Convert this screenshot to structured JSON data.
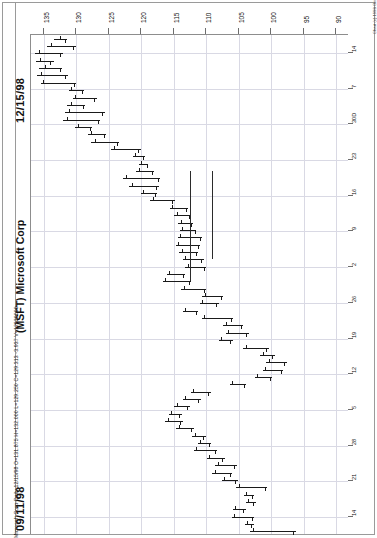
{
  "chart_data": {
    "type": "bar",
    "subtype": "ohlc-bar-chart-rotated",
    "title": "(MSFT) Microsoft Corp",
    "symbol": "MSFT",
    "company": "Microsoft Corp",
    "interval": "Daily",
    "orientation": "rotated-90-ccw",
    "grid": true,
    "legend": "none",
    "xlabel": "",
    "ylabel": "",
    "date_start_label": "09/11/98",
    "date_end_label": "12/15/98",
    "quote_line": "Microsoft Corp-Daily 12/15/98 O=131.875 H=132.000 L=129.250 C=129.313 -3.937 V=12620000",
    "quote": {
      "name": "Microsoft Corp-Daily",
      "date": "12/15/98",
      "open": 131.875,
      "high": 132.0,
      "low": 129.25,
      "close": 129.313,
      "change": -3.937,
      "volume": 12620000
    },
    "copyright": "Chart (c) 1998 Omega Research, Inc.  Data (c) Telescan",
    "price_axis": {
      "label": "Price",
      "ticks": [
        135,
        130,
        125,
        120,
        115,
        110,
        105,
        100,
        95,
        90
      ],
      "ylim": [
        137,
        88
      ]
    },
    "date_axis": {
      "label": "Date",
      "ticks": [
        "14",
        "7",
        "30D",
        "23",
        "16",
        "9",
        "2",
        "26",
        "19",
        "12",
        "5",
        "28",
        "21",
        "14"
      ],
      "months_shown": [
        "Sep",
        "Oct",
        "Nov",
        "Dec"
      ]
    },
    "series_name": "MSFT OHLC",
    "bars": [
      {
        "i": 0,
        "high": 133.5,
        "low": 131.5,
        "open": 132.5,
        "close": 131.8
      },
      {
        "i": 1,
        "high": 134.6,
        "low": 130.1,
        "open": 133.9,
        "close": 130.6
      },
      {
        "i": 2,
        "high": 136.4,
        "low": 132.1,
        "open": 135.8,
        "close": 132.6
      },
      {
        "i": 3,
        "high": 136.3,
        "low": 133.4,
        "open": 135.6,
        "close": 134.0
      },
      {
        "i": 4,
        "high": 135.7,
        "low": 132.2,
        "open": 134.9,
        "close": 132.6
      },
      {
        "i": 5,
        "high": 136.0,
        "low": 131.3,
        "open": 135.4,
        "close": 131.7
      },
      {
        "i": 6,
        "high": 135.5,
        "low": 130.0,
        "open": 135.1,
        "close": 130.3
      },
      {
        "i": 7,
        "high": 131.2,
        "low": 128.9,
        "open": 130.9,
        "close": 129.1
      },
      {
        "i": 8,
        "high": 130.6,
        "low": 126.9,
        "open": 130.2,
        "close": 127.3
      },
      {
        "i": 9,
        "high": 131.4,
        "low": 128.6,
        "open": 130.9,
        "close": 129.0
      },
      {
        "i": 10,
        "high": 131.7,
        "low": 125.6,
        "open": 131.2,
        "close": 126.1
      },
      {
        "i": 11,
        "high": 132.0,
        "low": 126.4,
        "open": 131.5,
        "close": 126.7
      },
      {
        "i": 12,
        "high": 130.2,
        "low": 127.6,
        "open": 129.8,
        "close": 127.9
      },
      {
        "i": 13,
        "high": 128.2,
        "low": 125.4,
        "open": 127.7,
        "close": 125.8
      },
      {
        "i": 14,
        "high": 127.7,
        "low": 123.4,
        "open": 127.2,
        "close": 123.8
      },
      {
        "i": 15,
        "high": 124.6,
        "low": 120.1,
        "open": 124.2,
        "close": 120.5
      },
      {
        "i": 16,
        "high": 121.3,
        "low": 119.4,
        "open": 120.9,
        "close": 119.7
      },
      {
        "i": 17,
        "high": 120.4,
        "low": 118.9,
        "open": 120.1,
        "close": 119.1
      },
      {
        "i": 18,
        "high": 120.8,
        "low": 118.0,
        "open": 120.4,
        "close": 118.4
      },
      {
        "i": 19,
        "high": 122.8,
        "low": 117.1,
        "open": 122.3,
        "close": 117.5
      },
      {
        "i": 20,
        "high": 121.9,
        "low": 117.3,
        "open": 121.4,
        "close": 117.7
      },
      {
        "i": 21,
        "high": 120.1,
        "low": 117.6,
        "open": 119.7,
        "close": 117.9
      },
      {
        "i": 22,
        "high": 118.6,
        "low": 114.8,
        "open": 118.2,
        "close": 115.2
      },
      {
        "i": 23,
        "high": 115.6,
        "low": 112.8,
        "open": 115.2,
        "close": 113.1
      },
      {
        "i": 24,
        "high": 114.9,
        "low": 112.4,
        "open": 114.5,
        "close": 112.7
      },
      {
        "i": 25,
        "high": 114.3,
        "low": 112.1,
        "open": 113.9,
        "close": 112.4
      },
      {
        "i": 26,
        "high": 114.1,
        "low": 111.5,
        "open": 113.7,
        "close": 111.8
      },
      {
        "i": 27,
        "high": 114.4,
        "low": 110.6,
        "open": 114.0,
        "close": 111.0
      },
      {
        "i": 28,
        "high": 114.7,
        "low": 110.9,
        "open": 114.3,
        "close": 111.2
      },
      {
        "i": 29,
        "high": 114.2,
        "low": 111.2,
        "open": 113.8,
        "close": 111.5
      },
      {
        "i": 30,
        "high": 113.6,
        "low": 110.4,
        "open": 113.2,
        "close": 110.8
      },
      {
        "i": 31,
        "high": 113.2,
        "low": 110.1,
        "open": 112.8,
        "close": 110.4
      },
      {
        "i": 32,
        "high": 116.1,
        "low": 113.2,
        "open": 115.7,
        "close": 113.6
      },
      {
        "i": 33,
        "high": 116.7,
        "low": 112.3,
        "open": 116.3,
        "close": 112.7
      },
      {
        "i": 34,
        "high": 113.9,
        "low": 110.0,
        "open": 113.5,
        "close": 110.4
      },
      {
        "i": 35,
        "high": 110.6,
        "low": 107.4,
        "open": 110.2,
        "close": 107.8
      },
      {
        "i": 36,
        "high": 111.0,
        "low": 108.1,
        "open": 110.6,
        "close": 108.5
      },
      {
        "i": 37,
        "high": 113.6,
        "low": 111.2,
        "open": 113.2,
        "close": 111.6
      },
      {
        "i": 38,
        "high": 110.7,
        "low": 105.8,
        "open": 110.3,
        "close": 106.2
      },
      {
        "i": 39,
        "high": 107.4,
        "low": 104.3,
        "open": 107.0,
        "close": 104.7
      },
      {
        "i": 40,
        "high": 107.0,
        "low": 103.4,
        "open": 106.6,
        "close": 103.8
      },
      {
        "i": 41,
        "high": 108.1,
        "low": 105.9,
        "open": 107.7,
        "close": 106.3
      },
      {
        "i": 42,
        "high": 104.3,
        "low": 100.4,
        "open": 103.9,
        "close": 100.8
      },
      {
        "i": 43,
        "high": 101.7,
        "low": 99.4,
        "open": 101.3,
        "close": 99.8
      },
      {
        "i": 44,
        "high": 100.8,
        "low": 97.6,
        "open": 100.4,
        "close": 98.0
      },
      {
        "i": 45,
        "high": 101.3,
        "low": 98.1,
        "open": 100.9,
        "close": 98.5
      },
      {
        "i": 46,
        "high": 102.5,
        "low": 99.8,
        "open": 102.1,
        "close": 100.2
      },
      {
        "i": 47,
        "high": 106.4,
        "low": 103.8,
        "open": 106.0,
        "close": 104.2
      },
      {
        "i": 48,
        "high": 112.4,
        "low": 109.3,
        "open": 112.0,
        "close": 109.7
      },
      {
        "i": 49,
        "high": 113.6,
        "low": 110.8,
        "open": 113.2,
        "close": 111.2
      },
      {
        "i": 50,
        "high": 114.9,
        "low": 112.5,
        "open": 114.5,
        "close": 112.9
      },
      {
        "i": 51,
        "high": 115.8,
        "low": 113.8,
        "open": 115.4,
        "close": 114.2
      },
      {
        "i": 52,
        "high": 116.3,
        "low": 113.6,
        "open": 115.9,
        "close": 114.0
      },
      {
        "i": 53,
        "high": 114.6,
        "low": 111.9,
        "open": 114.2,
        "close": 112.3
      },
      {
        "i": 54,
        "high": 112.2,
        "low": 110.1,
        "open": 111.8,
        "close": 110.5
      },
      {
        "i": 55,
        "high": 111.3,
        "low": 109.2,
        "open": 110.9,
        "close": 109.6
      },
      {
        "i": 56,
        "high": 111.9,
        "low": 108.3,
        "open": 111.5,
        "close": 108.7
      },
      {
        "i": 57,
        "high": 109.9,
        "low": 107.1,
        "open": 109.5,
        "close": 107.5
      },
      {
        "i": 58,
        "high": 108.6,
        "low": 105.3,
        "open": 108.2,
        "close": 105.7
      },
      {
        "i": 59,
        "high": 109.1,
        "low": 106.0,
        "open": 108.7,
        "close": 106.4
      },
      {
        "i": 60,
        "high": 107.6,
        "low": 105.1,
        "open": 107.2,
        "close": 105.5
      },
      {
        "i": 61,
        "high": 105.4,
        "low": 100.6,
        "open": 105.0,
        "close": 101.0
      },
      {
        "i": 62,
        "high": 104.2,
        "low": 102.6,
        "open": 103.8,
        "close": 103.0
      },
      {
        "i": 63,
        "high": 103.9,
        "low": 102.4,
        "open": 103.5,
        "close": 102.8
      },
      {
        "i": 64,
        "high": 105.9,
        "low": 103.9,
        "open": 105.5,
        "close": 104.3
      },
      {
        "i": 65,
        "high": 106.1,
        "low": 102.6,
        "open": 105.7,
        "close": 103.0
      },
      {
        "i": 66,
        "high": 104.1,
        "low": 102.7,
        "open": 103.7,
        "close": 103.1
      },
      {
        "i": 67,
        "high": 103.2,
        "low": 96.2,
        "open": 102.8,
        "close": 96.6
      }
    ],
    "cursor": {
      "visible": true,
      "price": 112.5,
      "date_index": 26
    }
  },
  "icons": {
    "chart_frame": "chart-frame"
  }
}
